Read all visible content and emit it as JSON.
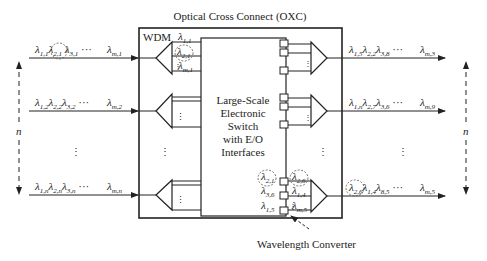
{
  "diagram": {
    "title": "Optical Cross Connect (OXC)",
    "wdm_label": "WDM",
    "switch_label_lines": [
      "Large-Scale",
      "Electronic",
      "Switch",
      "with E/O",
      "Interfaces"
    ],
    "converter_label": "Wavelength Converter",
    "n_label_left": "n",
    "n_label_right": "n",
    "ellipsis": "⋮",
    "inputs": [
      {
        "id": "in1",
        "labels": [
          [
            "λ",
            "1,1"
          ],
          [
            "λ",
            "2,1"
          ],
          [
            "λ",
            "3,1"
          ]
        ],
        "dots": "···",
        "last": [
          "λ",
          "m,1"
        ],
        "circled_index": 1
      },
      {
        "id": "in2",
        "labels": [
          [
            "λ",
            "1,2"
          ],
          [
            "λ",
            "2,2"
          ],
          [
            "λ",
            "3,2"
          ]
        ],
        "dots": "···",
        "last": [
          "λ",
          "m,2"
        ]
      },
      {
        "id": "inn",
        "labels": [
          [
            "λ",
            "1,n"
          ],
          [
            "λ",
            "2,n"
          ],
          [
            "λ",
            "3,n"
          ]
        ],
        "dots": "···",
        "last": [
          "λ",
          "m,n"
        ]
      }
    ],
    "outputs": [
      {
        "id": "out1",
        "labels": [
          [
            "λ",
            "1,5"
          ],
          [
            "λ",
            "2,2"
          ],
          [
            "λ",
            "3,8"
          ]
        ],
        "dots": "···",
        "last": [
          "λ",
          "m,3"
        ]
      },
      {
        "id": "out2",
        "labels": [
          [
            "λ",
            "1,n"
          ],
          [
            "λ",
            "2,7"
          ],
          [
            "λ",
            "3,6"
          ]
        ],
        "dots": "···",
        "last": [
          "λ",
          "m,9"
        ]
      },
      {
        "id": "outn",
        "labels": [
          [
            "λ",
            "2,6"
          ],
          [
            "λ",
            "1,4"
          ],
          [
            "λ",
            "8,5"
          ]
        ],
        "dots": "···",
        "last": [
          "λ",
          "m,5"
        ],
        "circled_index": 0
      }
    ],
    "demux_top_channels": [
      [
        "λ",
        "1,1"
      ],
      [
        "λ",
        "2,1"
      ],
      [
        "λ",
        "m,1"
      ]
    ],
    "bottom_switch_out": [
      [
        "λ",
        "2,1"
      ],
      [
        "λ",
        "3,6"
      ],
      [
        "λ",
        "1,5"
      ]
    ],
    "bottom_mux_in": [
      [
        "λ",
        "2,6"
      ],
      [
        "λ",
        "1,4"
      ],
      [
        "λ",
        "m,5"
      ]
    ]
  }
}
